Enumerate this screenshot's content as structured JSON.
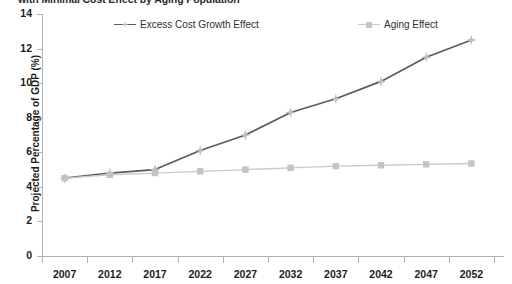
{
  "chart_data": {
    "type": "line",
    "title": "with Minimal Cost Effect by Aging Population",
    "subtitle": "",
    "xlabel": "",
    "ylabel": "Projected Percentage of GDP (%)",
    "categories": [
      "2007",
      "2012",
      "2017",
      "2022",
      "2027",
      "2032",
      "2037",
      "2042",
      "2047",
      "2052"
    ],
    "x": [
      2007,
      2012,
      2017,
      2022,
      2027,
      2032,
      2037,
      2042,
      2047,
      2052
    ],
    "series": [
      {
        "name": "Excess Cost Growth Effect",
        "color": "#5b5b5b",
        "marker": "star",
        "marker_color": "#bdbdbd",
        "values": [
          4.5,
          4.8,
          5.0,
          6.1,
          7.0,
          8.3,
          9.1,
          10.1,
          11.5,
          12.5
        ]
      },
      {
        "name": "Aging Effect",
        "color": "#c9c9c9",
        "marker": "square",
        "marker_color": "#c4c4c4",
        "values": [
          4.5,
          4.7,
          4.8,
          4.9,
          5.0,
          5.1,
          5.2,
          5.25,
          5.3,
          5.35
        ]
      }
    ],
    "ylim": [
      0,
      14
    ],
    "yticks": [
      0,
      2,
      4,
      6,
      8,
      10,
      12,
      14
    ],
    "ytick_labels": [
      "0",
      "2",
      "4",
      "6",
      "8",
      "10",
      "12",
      "14"
    ],
    "grid": false,
    "legend_position": "top",
    "legend_entries": [
      "Excess Cost Growth Effect",
      "Aging Effect"
    ],
    "background_color": "#ffffff",
    "axis_color": "#b3b3b3",
    "text_color": "#1c1c1c"
  }
}
